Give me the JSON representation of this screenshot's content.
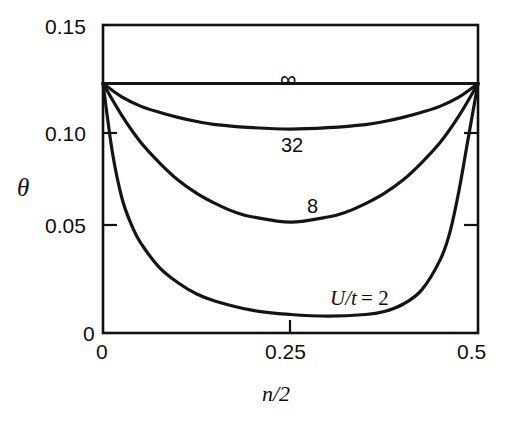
{
  "chart_data": {
    "type": "line",
    "title": "",
    "subtitle": "",
    "xlabel": "n/2",
    "ylabel": "θ",
    "xlim": [
      0,
      0.5
    ],
    "ylim": [
      0,
      0.15
    ],
    "grid": false,
    "legend_position": "inline-curve-labels",
    "xticks": [
      "0",
      "0.25",
      "0.5"
    ],
    "xtick_values": [
      0,
      0.25,
      0.5
    ],
    "yticks": [
      "0",
      "0.05",
      "0.10",
      "0.15"
    ],
    "ytick_values": [
      0,
      0.05,
      0.1,
      0.15
    ],
    "annotations": [
      {
        "text": "∞",
        "x": 0.25,
        "y": 0.135
      },
      {
        "text": "32",
        "x": 0.25,
        "y": 0.101
      },
      {
        "text": "8",
        "x": 0.28,
        "y": 0.068
      },
      {
        "text": "U/t = 2",
        "x": 0.33,
        "y": 0.023
      }
    ],
    "series": [
      {
        "name": "∞",
        "label": "∞",
        "color": "#141414",
        "x": [
          0.0,
          0.05,
          0.1,
          0.15,
          0.2,
          0.25,
          0.3,
          0.35,
          0.4,
          0.45,
          0.5
        ],
        "values": [
          0.1215,
          0.1215,
          0.1215,
          0.1215,
          0.1215,
          0.1215,
          0.1215,
          0.1215,
          0.1215,
          0.1215,
          0.1215
        ]
      },
      {
        "name": "32",
        "label": "32",
        "color": "#141414",
        "x": [
          0.0,
          0.025,
          0.05,
          0.075,
          0.1,
          0.125,
          0.15,
          0.2,
          0.25,
          0.3,
          0.35,
          0.375,
          0.4,
          0.425,
          0.45,
          0.475,
          0.5
        ],
        "values": [
          0.1215,
          0.115,
          0.1105,
          0.1075,
          0.105,
          0.103,
          0.1015,
          0.1,
          0.0993,
          0.1,
          0.1015,
          0.103,
          0.105,
          0.1075,
          0.1105,
          0.115,
          0.1215
        ]
      },
      {
        "name": "8",
        "label": "8",
        "color": "#141414",
        "x": [
          0.0,
          0.025,
          0.05,
          0.075,
          0.1,
          0.125,
          0.15,
          0.175,
          0.2,
          0.25,
          0.3,
          0.325,
          0.35,
          0.375,
          0.4,
          0.425,
          0.45,
          0.475,
          0.5
        ],
        "values": [
          0.1215,
          0.106,
          0.093,
          0.083,
          0.0745,
          0.068,
          0.063,
          0.059,
          0.0565,
          0.054,
          0.0565,
          0.059,
          0.063,
          0.068,
          0.0745,
          0.083,
          0.093,
          0.106,
          0.1215
        ]
      },
      {
        "name": "U/t = 2",
        "label": "U/t = 2",
        "color": "#141414",
        "x": [
          0.0,
          0.0125,
          0.025,
          0.0375,
          0.05,
          0.075,
          0.1,
          0.125,
          0.15,
          0.2,
          0.25,
          0.3,
          0.35,
          0.375,
          0.4,
          0.425,
          0.45,
          0.4625,
          0.475,
          0.4875,
          0.5
        ],
        "values": [
          0.1215,
          0.088,
          0.066,
          0.053,
          0.044,
          0.032,
          0.0245,
          0.019,
          0.0155,
          0.011,
          0.009,
          0.0082,
          0.009,
          0.0105,
          0.014,
          0.021,
          0.036,
          0.049,
          0.07,
          0.096,
          0.1215
        ]
      }
    ]
  },
  "axes": {
    "y_title": "θ",
    "x_title": "n/2",
    "y_tick_015": "0.15",
    "y_tick_010": "0.10",
    "y_tick_005": "0.05",
    "y_tick_000": "0",
    "x_tick_000": "0",
    "x_tick_025": "0.25",
    "x_tick_050": "0.5"
  },
  "curve_labels": {
    "infinity": "∞",
    "thirty_two": "32",
    "eight": "8",
    "u_over_t": "U/t = 2",
    "u_over_t_symbol": "U/t",
    "u_over_t_equals": "= 2"
  },
  "colors": {
    "ink": "#141414",
    "background": "#ffffff"
  }
}
